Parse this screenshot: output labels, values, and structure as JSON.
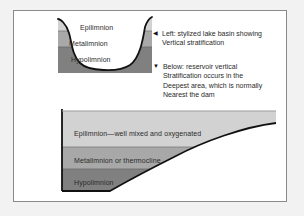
{
  "figure": {
    "colors": {
      "epilimnion": "#d2d2d2",
      "metalimnion": "#a8a8a8",
      "hypolimnion": "#808080",
      "outline": "#111111",
      "page_background": "#f2f2f2",
      "frame_background": "#ffffff",
      "frame_border": "#8a8a8a",
      "text": "#2b2b2b"
    },
    "upper_diagram": {
      "name": "stylized lake basin cross section",
      "layers": [
        {
          "label": "Epilimnion",
          "shade": "light"
        },
        {
          "label": "Metalimnion",
          "shade": "medium"
        },
        {
          "label": "Hypolimnion",
          "shade": "dark"
        }
      ]
    },
    "lower_diagram": {
      "name": "reservoir vertical stratification cross section",
      "layers": [
        {
          "label": "Epilimnion—well mixed and oxygenated",
          "shade": "light"
        },
        {
          "label": "Metalimnion or thermocline",
          "shade": "medium"
        },
        {
          "label": "Hypolimnion",
          "shade": "dark"
        }
      ]
    },
    "notes": [
      {
        "marker": "◀",
        "marker_name": "left-pointing-triangle-icon",
        "lines": [
          "Left: stylized lake basin showing",
          "Vertical stratification"
        ]
      },
      {
        "marker": "▼",
        "marker_name": "down-pointing-triangle-icon",
        "lines": [
          "Below: reservoir vertical",
          "Stratification occurs in the",
          "Deepest area, which is normally",
          "Nearest the dam"
        ]
      }
    ]
  }
}
